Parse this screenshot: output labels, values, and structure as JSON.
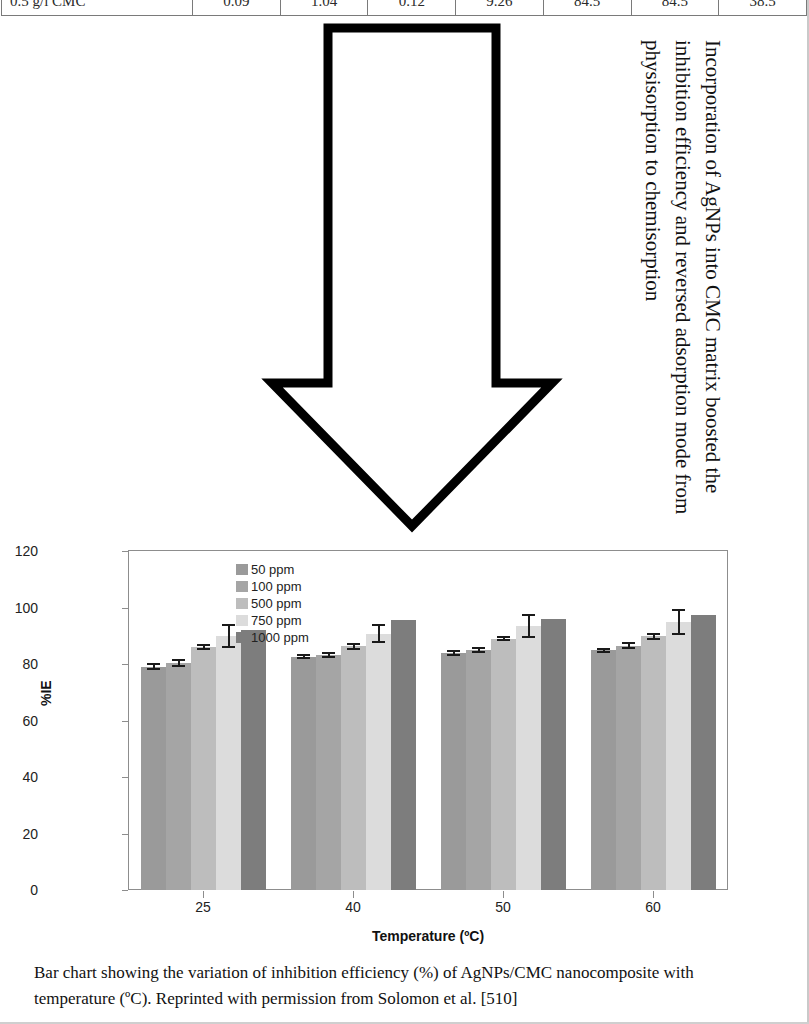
{
  "table": {
    "row": {
      "label": "0.5 g/l CMC",
      "values": [
        "0.09",
        "1.04",
        "0.12",
        "9.26",
        "84.5",
        "84.5",
        "38.5"
      ]
    }
  },
  "callout": {
    "text": "Incorporation of AgNPs into CMC matrix boosted the inhibition efficiency and reversed adsorption mode from physisorption to chemisorption",
    "shape": "down-arrow"
  },
  "caption": {
    "text": "Bar chart showing the variation of inhibition efficiency (%) of AgNPs/CMC nanocomposite with temperature (ºC). Reprinted with permission from Solomon et al. [510]"
  },
  "chart_data": {
    "type": "bar",
    "title": "",
    "xlabel": "Temperature (ºC)",
    "ylabel": "%IE",
    "categories": [
      "25",
      "40",
      "50",
      "60"
    ],
    "ylim": [
      0,
      120
    ],
    "yticks": [
      0,
      20,
      40,
      60,
      80,
      100,
      120
    ],
    "grid": false,
    "legend_position": "top-center",
    "series": [
      {
        "name": "50 ppm",
        "color": "#9a9a9a",
        "values": [
          79.0,
          82.5,
          83.8,
          84.8
        ],
        "errors": [
          1.2,
          0.9,
          1.0,
          1.0
        ]
      },
      {
        "name": "100 ppm",
        "color": "#a5a5a5",
        "values": [
          80.3,
          83.3,
          85.0,
          86.5
        ],
        "errors": [
          1.5,
          1.0,
          1.0,
          1.2
        ]
      },
      {
        "name": "500 ppm",
        "color": "#bdbdbd",
        "values": [
          86.0,
          86.3,
          89.0,
          89.8
        ],
        "errors": [
          1.2,
          1.3,
          1.0,
          1.3
        ]
      },
      {
        "name": "750 ppm",
        "color": "#dcdcdc",
        "values": [
          89.8,
          90.8,
          93.5,
          94.8
        ],
        "errors": [
          4.2,
          3.5,
          4.2,
          4.5
        ]
      },
      {
        "name": "1000 ppm",
        "color": "#7d7d7d",
        "values": [
          92.0,
          95.5,
          96.0,
          97.5
        ],
        "errors": [
          0.0,
          0.0,
          0.0,
          0.0
        ]
      }
    ]
  }
}
